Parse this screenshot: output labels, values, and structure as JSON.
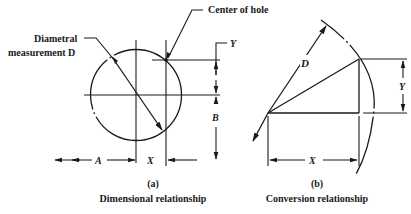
{
  "figure": {
    "panel_a": {
      "tag": "(a)",
      "caption": "Dimensional relationship",
      "labels": {
        "diameter_line1": "Diametral",
        "diameter_line2": "measurement D",
        "center": "Center of hole",
        "y": "Y",
        "b": "B",
        "a": "A",
        "x": "X"
      }
    },
    "panel_b": {
      "tag": "(b)",
      "caption": "Conversion relationship",
      "labels": {
        "d": "D",
        "y": "Y",
        "x": "X"
      }
    }
  }
}
